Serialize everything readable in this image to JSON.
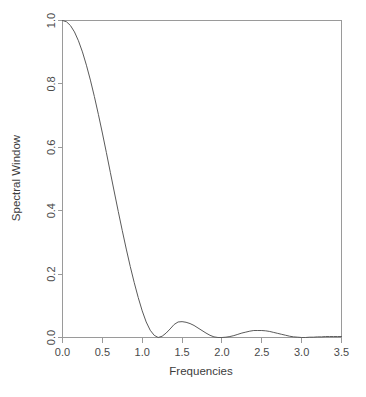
{
  "chart_data": {
    "type": "line",
    "title": "",
    "xlabel": "Frequencies",
    "ylabel": "Spectral Window",
    "xlim": [
      0.0,
      3.5
    ],
    "ylim": [
      0.0,
      1.0
    ],
    "grid": false,
    "legend": null,
    "axis_color": "#9a9a9a",
    "line_color": "#5a5a5a",
    "background_color": "#ffffff",
    "xticks": [
      {
        "value": 0.0,
        "label": "0.0"
      },
      {
        "value": 0.5,
        "label": "0.5"
      },
      {
        "value": 1.0,
        "label": "1.0"
      },
      {
        "value": 1.5,
        "label": "1.5"
      },
      {
        "value": 2.0,
        "label": "2.0"
      },
      {
        "value": 2.5,
        "label": "2.5"
      },
      {
        "value": 3.0,
        "label": "3.0"
      },
      {
        "value": 3.5,
        "label": "3.5"
      }
    ],
    "yticks": [
      {
        "value": 0.0,
        "label": "0.0"
      },
      {
        "value": 0.2,
        "label": "0.2"
      },
      {
        "value": 0.4,
        "label": "0.4"
      },
      {
        "value": 0.6,
        "label": "0.6"
      },
      {
        "value": 0.8,
        "label": "0.8"
      },
      {
        "value": 1.0,
        "label": "1.0"
      }
    ],
    "series": [
      {
        "name": "spectral-window",
        "x": [
          0.0,
          0.05,
          0.1,
          0.15,
          0.2,
          0.25,
          0.3,
          0.35,
          0.4,
          0.45,
          0.5,
          0.55,
          0.6,
          0.65,
          0.7,
          0.75,
          0.8,
          0.85,
          0.9,
          0.95,
          1.0,
          1.05,
          1.1,
          1.15,
          1.2,
          1.25,
          1.3,
          1.35,
          1.4,
          1.45,
          1.5,
          1.55,
          1.6,
          1.65,
          1.7,
          1.75,
          1.8,
          1.85,
          1.9,
          1.95,
          2.0,
          2.05,
          2.1,
          2.15,
          2.2,
          2.25,
          2.3,
          2.35,
          2.4,
          2.45,
          2.5,
          2.55,
          2.6,
          2.65,
          2.7,
          2.75,
          2.8,
          2.85,
          2.9,
          2.95,
          3.0,
          3.05,
          3.1,
          3.15,
          3.2,
          3.25,
          3.3,
          3.35,
          3.4,
          3.45,
          3.5
        ],
        "y": [
          1.0,
          0.996,
          0.984,
          0.964,
          0.936,
          0.901,
          0.859,
          0.812,
          0.76,
          0.704,
          0.645,
          0.584,
          0.521,
          0.459,
          0.397,
          0.337,
          0.279,
          0.224,
          0.173,
          0.126,
          0.084,
          0.049,
          0.023,
          0.007,
          0.0,
          0.004,
          0.014,
          0.027,
          0.041,
          0.049,
          0.05,
          0.048,
          0.044,
          0.038,
          0.03,
          0.022,
          0.014,
          0.007,
          0.002,
          0.0,
          0.0,
          0.001,
          0.003,
          0.006,
          0.01,
          0.014,
          0.017,
          0.02,
          0.022,
          0.022,
          0.022,
          0.021,
          0.019,
          0.016,
          0.013,
          0.01,
          0.007,
          0.004,
          0.002,
          0.001,
          0.0,
          0.0,
          0.001,
          0.001,
          0.002,
          0.002,
          0.003,
          0.003,
          0.003,
          0.003,
          0.003
        ],
        "color": "#5a5a5a"
      }
    ],
    "annotations": {
      "main_lobe_peak": {
        "x": 0.0,
        "y": 1.0
      },
      "first_null": {
        "x": 1.22,
        "y": 0.0
      },
      "first_sidelobe_peak": {
        "x": 1.47,
        "y": 0.05
      },
      "second_null": {
        "x": 1.97,
        "y": 0.0
      },
      "second_sidelobe_peak": {
        "x": 2.47,
        "y": 0.022
      },
      "third_null": {
        "x": 3.0,
        "y": 0.0
      }
    }
  }
}
